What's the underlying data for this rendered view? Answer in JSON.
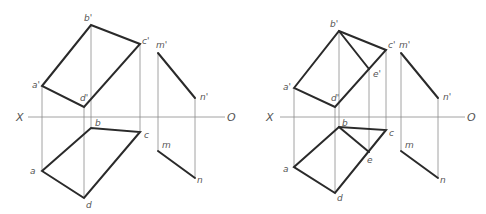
{
  "figures": [
    {
      "id": "left",
      "axis_labels": {
        "left": "X",
        "right": "O"
      },
      "points": {
        "b_prime": "b'",
        "c_prime": "c'",
        "a_prime": "a'",
        "d_prime": "d'",
        "b": "b",
        "c": "c",
        "a": "a",
        "d": "d",
        "m_prime": "m'",
        "n_prime": "n'",
        "m": "m",
        "n": "n"
      }
    },
    {
      "id": "right",
      "axis_labels": {
        "left": "X",
        "right": "O"
      },
      "points": {
        "b_prime": "b'",
        "c_prime": "c'",
        "a_prime": "a'",
        "d_prime": "d'",
        "e_prime": "e'",
        "b": "b",
        "c": "c",
        "a": "a",
        "d": "d",
        "e": "e",
        "m_prime": "m'",
        "n_prime": "n'",
        "m": "m",
        "n": "n"
      }
    }
  ]
}
